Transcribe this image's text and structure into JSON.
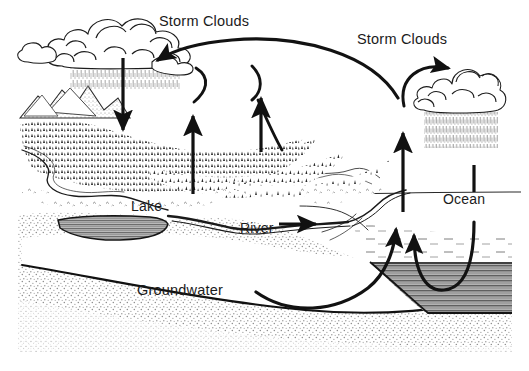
{
  "diagram": {
    "background_color": "#ffffff",
    "ink_color": "#000000",
    "width": 529,
    "height": 371
  },
  "labels": {
    "storm_clouds_left": "Storm Clouds",
    "storm_clouds_right": "Storm Clouds",
    "lake": "Lake",
    "river": "River",
    "ocean": "Ocean",
    "groundwater": "Groundwater"
  },
  "features": {
    "left_cloud": "storm-cloud-cluster-left",
    "right_cloud": "storm-cloud-cluster-right",
    "left_rain": "rainfall-streaks-left",
    "right_rain": "rainfall-streaks-right",
    "mountains": "mountain-range",
    "forest": "conifer-forest",
    "lake_basin": "lake-water-body",
    "ocean_basin": "ocean-water-body",
    "aquifer": "groundwater-aquifer-band",
    "soil": "stippled-soil-layer"
  },
  "arrows": {
    "precipitation_left": "downward-precipitation-arrow",
    "evaporation_forest_left": "upward-evapotranspiration-arrow",
    "evaporation_forest_right": "upward-evapotranspiration-arrow",
    "ocean_evaporation": "upward-ocean-evaporation-arrow",
    "river_flow": "rightward-river-flow-arrow",
    "air_transport_long": "long-atmospheric-transport-arc",
    "air_transport_right": "short-atmospheric-transport-arc",
    "groundwater_flow": "groundwater-discharge-arc",
    "ocean_circulation": "ocean-circulation-u-arc"
  },
  "colors": {
    "ink": "#141414",
    "water_gray": "#8e8e8e",
    "water_gray_dark": "#6f6f6f",
    "soil_stipple": "#9a9a9a",
    "rain_gray": "#9d9d9d",
    "label_text": "#1b1b1b"
  }
}
